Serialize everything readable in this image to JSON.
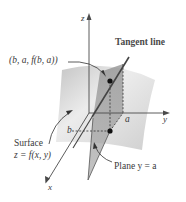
{
  "diagram": {
    "axes": {
      "z_label": "z",
      "y_label": "y",
      "x_label": "x"
    },
    "labels": {
      "point": "(b, a, f(b, a))",
      "tangent_line": "Tangent line",
      "surface_title": "Surface",
      "surface_eq": "z = f(x, y)",
      "plane": "Plane y = a",
      "a_tick": "a",
      "b_tick": "b"
    },
    "colors": {
      "surface_light": "#e6e6e6",
      "surface_dark": "#b9b9b9",
      "plane": "#9a9a9a",
      "axis": "#4a4a4a",
      "tangent": "#444444",
      "text": "#3a3a3a"
    }
  }
}
